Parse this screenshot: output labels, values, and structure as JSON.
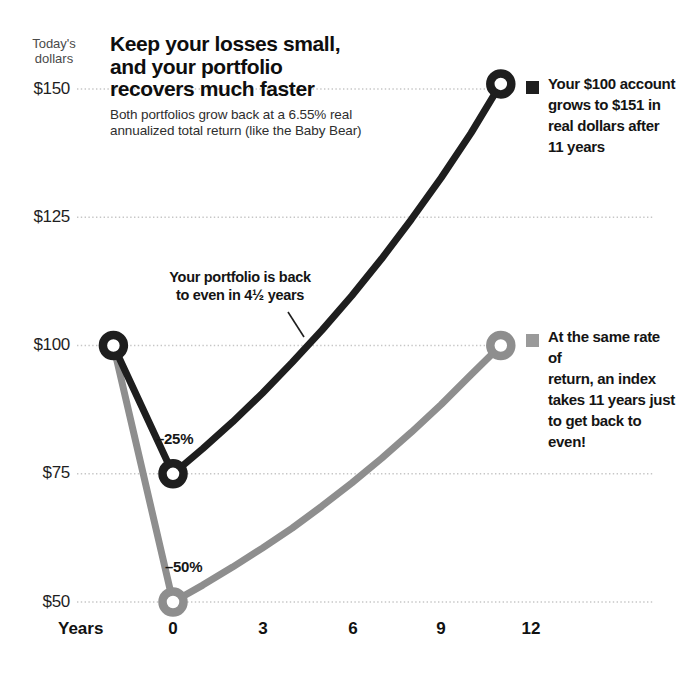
{
  "header": {
    "unit_label_line1": "Today's",
    "unit_label_line2": "dollars",
    "title_line1": "Keep your losses small,",
    "title_line2": "and your portfolio",
    "title_line3": "recovers much faster",
    "subtitle_line1": "Both portfolios grow back at a 6.55% real",
    "subtitle_line2": "annualized total return (like the Baby Bear)"
  },
  "axis": {
    "x_title": "Years",
    "x_ticks": [
      "0",
      "3",
      "6",
      "9",
      "12"
    ],
    "y_ticks": [
      "$150",
      "$125",
      "$100",
      "$75",
      "$50"
    ]
  },
  "annotations": {
    "callout_line1": "Your portfolio is back",
    "callout_line2": "to even in 4½ years",
    "black_drawdown_label": "–25%",
    "gray_drawdown_label": "–50%"
  },
  "legends": {
    "black": {
      "line1": "Your $100 account",
      "line2": "grows to $151 in",
      "line3": "real dollars after",
      "line4": "11 years"
    },
    "gray": {
      "line1": "At the same rate of",
      "line2": "return, an index",
      "line3": "takes 11 years just",
      "line4": "to get back to even!"
    }
  },
  "colors": {
    "black_series": "#1e1e1e",
    "gray_series": "#8e8e8e",
    "gray_bullet": "#9a9a9a",
    "grid": "#c6c6c6",
    "marker_fill": "#ffffff"
  },
  "chart_data": {
    "type": "line",
    "title": "Keep your losses small, and your portfolio recovers much faster",
    "subtitle": "Both portfolios grow back at a 6.55% real annualized total return (like the Baby Bear)",
    "xlabel": "Years",
    "ylabel": "Today's dollars",
    "x_ticks": [
      0,
      3,
      6,
      9,
      12
    ],
    "y_ticks": [
      50,
      75,
      100,
      125,
      150
    ],
    "xlim": [
      -2.5,
      13
    ],
    "ylim": [
      50,
      155
    ],
    "grid": "horizontal-dotted",
    "annualized_real_return_pct": 6.55,
    "series": [
      {
        "name": "Your $100 account (–25% loss, grows to $151 after 11 years)",
        "color": "#1e1e1e",
        "back_to_even_years": 4.5,
        "points": [
          [
            -2,
            100
          ],
          [
            0,
            75
          ],
          [
            1,
            79.9
          ],
          [
            2,
            85.1
          ],
          [
            3,
            90.7
          ],
          [
            4,
            96.7
          ],
          [
            5,
            103.0
          ],
          [
            6,
            109.7
          ],
          [
            7,
            116.9
          ],
          [
            8,
            124.6
          ],
          [
            9,
            132.7
          ],
          [
            10,
            141.4
          ],
          [
            11,
            151
          ]
        ],
        "markers": [
          [
            -2,
            100
          ],
          [
            0,
            75
          ],
          [
            11,
            151
          ]
        ]
      },
      {
        "name": "Index (–50% loss, takes 11 years to get back to even)",
        "color": "#8e8e8e",
        "back_to_even_years": 11,
        "points": [
          [
            -2,
            100
          ],
          [
            0,
            50
          ],
          [
            1,
            53.3
          ],
          [
            2,
            56.8
          ],
          [
            3,
            60.5
          ],
          [
            4,
            64.4
          ],
          [
            5,
            68.7
          ],
          [
            6,
            73.2
          ],
          [
            7,
            78.0
          ],
          [
            8,
            83.1
          ],
          [
            9,
            88.5
          ],
          [
            10,
            94.3
          ],
          [
            11,
            100
          ]
        ],
        "markers": [
          [
            0,
            50
          ],
          [
            11,
            100
          ]
        ]
      }
    ]
  }
}
